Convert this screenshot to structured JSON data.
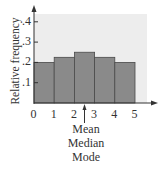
{
  "chart_data": {
    "type": "bar",
    "subtype": "histogram",
    "title": "",
    "xlabel": "",
    "ylabel": "Relative frequency",
    "bin_edges": [
      0,
      1,
      2,
      3,
      4,
      5
    ],
    "categories": [
      "0-1",
      "1-2",
      "2-3",
      "3-4",
      "4-5"
    ],
    "values": [
      0.2,
      0.225,
      0.25,
      0.225,
      0.2
    ],
    "x_ticks": [
      "0",
      "1",
      "2",
      "3",
      "4",
      "5"
    ],
    "y_ticks": [
      ".1",
      ".2",
      ".3",
      ".4"
    ],
    "y_tick_values": [
      0.1,
      0.2,
      0.3,
      0.4
    ],
    "ylim": [
      0,
      0.45
    ],
    "xlim": [
      0,
      5.5
    ],
    "grid": false,
    "legend": null,
    "annotations": [
      {
        "x": 2.5,
        "text": [
          "Mean",
          "Median",
          "Mode"
        ],
        "arrow": "up"
      }
    ],
    "colors": {
      "bar": "#8a8a8a",
      "bar_edge": "#4a4a4a",
      "plot_bg": "#ececec",
      "axis": "#333333"
    }
  },
  "labels": {
    "ylabel": "Relative frequency",
    "annotation_lines": [
      "Mean",
      "Median",
      "Mode"
    ]
  }
}
